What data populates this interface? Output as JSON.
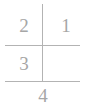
{
  "diagram": {
    "type": "quadrant-number-diagram",
    "width": 86,
    "height": 109,
    "background_color": "#ffffff",
    "line_color": "#b3b3b3",
    "text_color": "#a6a6a6",
    "labels": {
      "upper_left": "2",
      "upper_right": "1",
      "lower_left": "3",
      "bottom_center": "4"
    },
    "lines": {
      "middle_horizontal": "horizontal-rule",
      "bottom_horizontal": "horizontal-rule",
      "vertical": "vertical-rule"
    }
  }
}
